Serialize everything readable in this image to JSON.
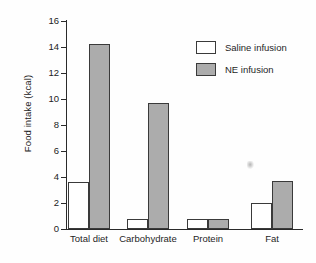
{
  "chart_data": {
    "type": "bar",
    "title": "",
    "xlabel": "",
    "ylabel": "Food intake (kcal)",
    "categories": [
      "Total diet",
      "Carbohydrate",
      "Protein",
      "Fat"
    ],
    "series": [
      {
        "name": "Saline infusion",
        "color": "#ffffff",
        "values": [
          3.6,
          0.8,
          0.8,
          2.0
        ]
      },
      {
        "name": "NE infusion",
        "color": "#acacac",
        "values": [
          14.2,
          9.7,
          0.8,
          3.7
        ]
      }
    ],
    "ylim": [
      0,
      16
    ],
    "ytick_values": [
      0,
      2,
      4,
      6,
      8,
      10,
      12,
      14,
      16
    ],
    "ytick_labels": [
      "0",
      "2",
      "4",
      "6",
      "8",
      "10",
      "12",
      "14",
      "16"
    ],
    "grid": false,
    "legend_position": "top-right-inside",
    "legend_entries": [
      {
        "label": "Saline infusion",
        "swatch": "open-square"
      },
      {
        "label": "NE infusion",
        "swatch": "filled-gray-square"
      }
    ],
    "annotations": [
      {
        "name": "scan-speck",
        "text": ""
      }
    ]
  }
}
